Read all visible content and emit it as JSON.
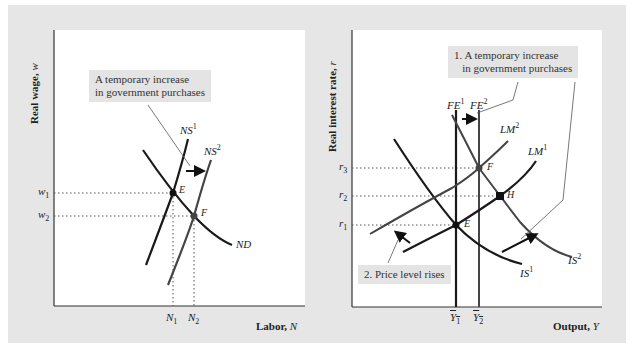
{
  "left_chart": {
    "y_axis_label": "Real wage, ",
    "y_axis_var": "w",
    "x_axis_label": "Labor, ",
    "x_axis_var": "N",
    "callout": "A temporary increase\nin government purchases",
    "curves": {
      "ns1": {
        "name": "NS",
        "sup": "1"
      },
      "ns2": {
        "name": "NS",
        "sup": "2"
      },
      "nd": {
        "name": "ND"
      }
    },
    "points": {
      "e": "E",
      "f": "F"
    },
    "y_ticks": [
      {
        "var": "w",
        "sub": "1"
      },
      {
        "var": "w",
        "sub": "2"
      }
    ],
    "x_ticks": [
      {
        "var": "N",
        "sub": "1"
      },
      {
        "var": "N",
        "sub": "2"
      }
    ]
  },
  "right_chart": {
    "y_axis_label": "Real interest rate, ",
    "y_axis_var": "r",
    "x_axis_label": "Output, ",
    "x_axis_var": "Y",
    "callout_1": "1. A temporary increase\n   in government purchases",
    "callout_2": "2. Price level rises",
    "curves": {
      "fe1": {
        "name": "FE",
        "sup": "1"
      },
      "fe2": {
        "name": "FE",
        "sup": "2"
      },
      "lm1": {
        "name": "LM",
        "sup": "1"
      },
      "lm2": {
        "name": "LM",
        "sup": "2"
      },
      "is1": {
        "name": "IS",
        "sup": "1"
      },
      "is2": {
        "name": "IS",
        "sup": "2"
      }
    },
    "points": {
      "e": "E",
      "f": "F",
      "h": "H"
    },
    "y_ticks": [
      {
        "var": "r",
        "sub": "3"
      },
      {
        "var": "r",
        "sub": "2"
      },
      {
        "var": "r",
        "sub": "1"
      }
    ],
    "x_ticks": [
      {
        "var": "Y",
        "sub": "1"
      },
      {
        "var": "Y",
        "sub": "2"
      }
    ]
  },
  "colors": {
    "panel_bg": "#e6e6e6",
    "plot_bg": "#ffffff",
    "curve_dark": "#1a1a1a",
    "curve_gray": "#555555",
    "callout_bg": "#e4e4e4"
  }
}
